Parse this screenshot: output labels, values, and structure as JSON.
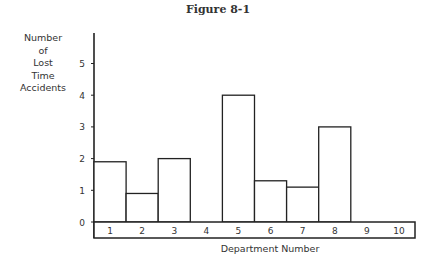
{
  "figure": {
    "title": "Figure 8-1"
  },
  "chart_data": {
    "type": "bar",
    "title": "Figure 8-1",
    "xlabel": "Department Number",
    "ylabel": "Number of Lost Time Accidents",
    "categories": [
      "1",
      "2",
      "3",
      "4",
      "5",
      "6",
      "7",
      "8",
      "9",
      "10"
    ],
    "values": [
      1.9,
      0.9,
      2.0,
      0,
      4.0,
      1.3,
      1.1,
      3.0,
      0,
      0
    ],
    "yticks": [
      0,
      1,
      2,
      3,
      4,
      5
    ],
    "ylim": [
      0,
      6
    ],
    "grid": false,
    "legend": null
  },
  "labels": {
    "ylabel_lines": [
      "Number",
      "of",
      "Lost",
      "Time",
      "Accidents"
    ],
    "xlabel": "Department Number"
  }
}
